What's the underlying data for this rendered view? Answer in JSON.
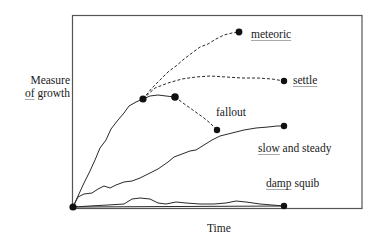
{
  "diagram": {
    "type": "growth-trajectories",
    "xlabel": "Time",
    "ylabel": {
      "line1": "Measure",
      "line2_underlined": "of",
      "line2_rest": " growth"
    },
    "colors": {
      "line": "#2a2a2a",
      "frame": "#555555",
      "dot": "#111111",
      "underline": "#a9a9a9"
    },
    "trajectories": [
      {
        "name": "meteoric",
        "label": "meteoric",
        "style": "dashed",
        "underlined": "meteoric",
        "rest": ""
      },
      {
        "name": "settle",
        "label": "settle",
        "style": "dashed",
        "underlined": "settle",
        "rest": ""
      },
      {
        "name": "fallout",
        "label": "fallout",
        "style": "dashed",
        "underlined": "",
        "rest": "fallout"
      },
      {
        "name": "slow-and-steady",
        "label": "slow and steady",
        "style": "solid",
        "underlined": "slow",
        "rest": " and steady"
      },
      {
        "name": "damp-squib",
        "label": "damp squib",
        "style": "solid",
        "underlined": "damp",
        "rest": " squib"
      }
    ]
  }
}
